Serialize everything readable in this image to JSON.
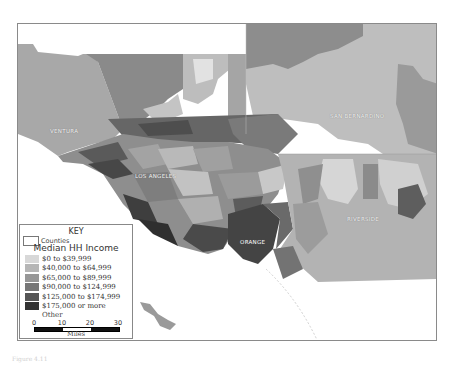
{
  "map": {
    "title": "",
    "county_labels": [
      {
        "name": "VENTURA",
        "x": 32,
        "y": 104
      },
      {
        "name": "LOS ANGELES",
        "x": 117,
        "y": 149
      },
      {
        "name": "SAN BERNARDINO",
        "x": 312,
        "y": 89
      },
      {
        "name": "RIVERSIDE",
        "x": 329,
        "y": 192
      },
      {
        "name": "ORANGE",
        "x": 222,
        "y": 215
      }
    ]
  },
  "legend": {
    "title": "KEY",
    "counties_label": "Counties",
    "subtitle": "Median HH Income",
    "items": [
      {
        "label": "$0 to $39,999",
        "color": "#d8d8d8"
      },
      {
        "label": "$40,000 to $64,999",
        "color": "#b6b6b6"
      },
      {
        "label": "$65,000 to $89,999",
        "color": "#979797"
      },
      {
        "label": "$90,000 to $124,999",
        "color": "#777777"
      },
      {
        "label": "$125,000 to $174,999",
        "color": "#555555"
      },
      {
        "label": "$175,000 or more",
        "color": "#333333"
      }
    ],
    "other_label": "Other",
    "scale": {
      "ticks": [
        "0",
        "10",
        "20",
        "30"
      ],
      "unit": "Miles"
    }
  },
  "caption": "Figure 4.11"
}
